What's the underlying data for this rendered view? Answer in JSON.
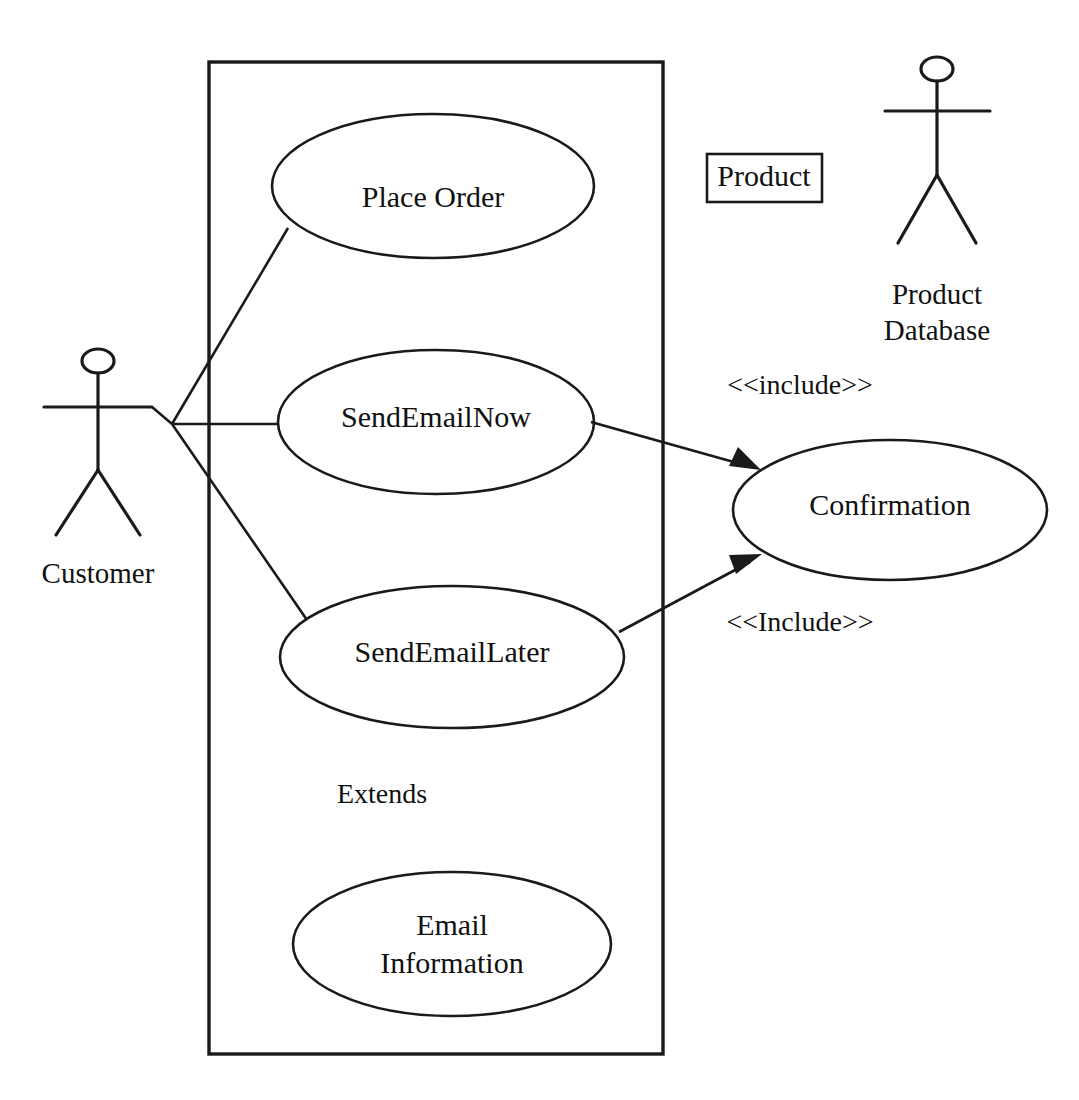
{
  "diagram": {
    "kind": "uml-use-case-diagram",
    "title": "",
    "colors": {
      "stroke": "#1a1a1a",
      "fill": "#ffffff",
      "text": "#111111",
      "background": "#ffffff"
    },
    "system_boundary": {
      "name": "system-boundary",
      "label": ""
    },
    "actors": [
      {
        "id": "customer",
        "label": "Customer"
      },
      {
        "id": "product-database",
        "label_line1": "Product",
        "label_line2": "Database",
        "label": "Product Database"
      }
    ],
    "use_cases": [
      {
        "id": "place-order",
        "label": "Place Order"
      },
      {
        "id": "send-email-now",
        "label": "SendEmailNow"
      },
      {
        "id": "send-email-later",
        "label": "SendEmailLater"
      },
      {
        "id": "confirmation",
        "label": "Confirmation"
      },
      {
        "id": "email-information",
        "label_line1": "Email",
        "label_line2": "Information",
        "label": "Email Information"
      }
    ],
    "boxes": [
      {
        "id": "product-box",
        "label": "Product"
      }
    ],
    "annotations": [
      {
        "id": "include-upper",
        "label": "<<include>>"
      },
      {
        "id": "include-lower",
        "label": "<<Include>>"
      },
      {
        "id": "extends-note",
        "label": "Extends"
      }
    ],
    "associations": [
      {
        "from": "customer",
        "to": "place-order",
        "type": "association"
      },
      {
        "from": "customer",
        "to": "send-email-now",
        "type": "association"
      },
      {
        "from": "customer",
        "to": "send-email-later",
        "type": "association"
      },
      {
        "from": "send-email-now",
        "to": "confirmation",
        "type": "include",
        "label": "<<include>>"
      },
      {
        "from": "send-email-later",
        "to": "confirmation",
        "type": "include",
        "label": "<<Include>>"
      }
    ]
  }
}
